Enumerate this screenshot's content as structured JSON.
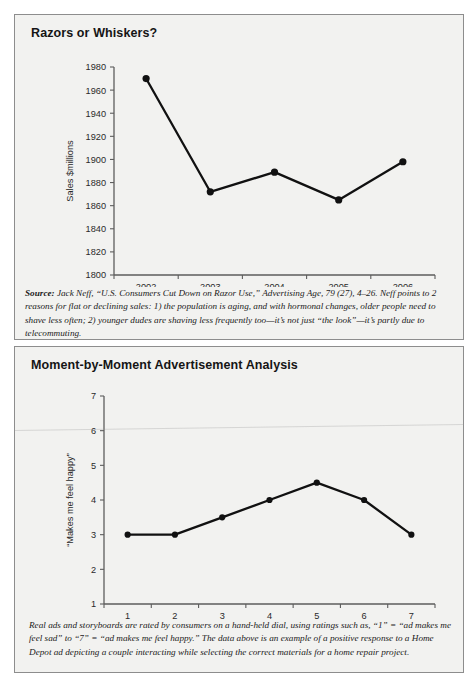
{
  "document": {
    "background_color": "#ffffff",
    "panel_color": "#f2f2f0",
    "border_color": "#8d8d8d",
    "ink_color": "#111111"
  },
  "exhibits": [
    {
      "title": "Razors or Whiskers?",
      "caption_lead": "Source:",
      "caption_body": " Jack Neff, “U.S. Consumers Cut Down on Razor Use,” Advertising Age, 79 (27), 4–26. Neff points to 2 reasons for flat or declining sales: 1) the population is aging, and with hormonal changes, older people need to shave less often; 2) younger dudes are shaving less frequently too—it’s not just “the look”—it’s partly due to telecommuting."
    },
    {
      "title": "Moment-by-Moment Advertisement Analysis",
      "caption_lead": "",
      "caption_body": "Real ads and storyboards are rated by consumers on a hand-held dial, using ratings such as, “1” = “ad makes me feel sad” to “7” = “ad makes me feel happy.” The data above is an example of a positive response to a Home Depot ad depicting a couple interacting while selecting the correct materials for a home repair project."
    }
  ],
  "chart_data": [
    {
      "type": "line",
      "title": "Razors or Whiskers?",
      "xlabel": "",
      "ylabel": "Sales $millions",
      "categories": [
        "2002",
        "2003",
        "2004",
        "2005",
        "2006"
      ],
      "x": [
        2002,
        2003,
        2004,
        2005,
        2006
      ],
      "values": [
        1970,
        1872,
        1889,
        1865,
        1898
      ],
      "ylim": [
        1800,
        1980
      ],
      "yticks": [
        1800,
        1820,
        1840,
        1860,
        1880,
        1900,
        1920,
        1940,
        1960,
        1980
      ],
      "ytick_labels": [
        "1800",
        "1820",
        "1840",
        "1860",
        "1880",
        "1900",
        "1920",
        "1940",
        "1960",
        "1980"
      ],
      "xtick_labels": [
        "2002",
        "2003",
        "2004",
        "2005",
        "2006"
      ],
      "grid": false,
      "legend": "none",
      "marker": "filled-circle",
      "line_color": "#111111"
    },
    {
      "type": "line",
      "title": "Moment-by-Moment Advertisement Analysis",
      "xlabel": "",
      "ylabel": "“Makes me feel happy”",
      "categories": [
        "1",
        "2",
        "3",
        "4",
        "5",
        "6",
        "7"
      ],
      "x": [
        1,
        2,
        3,
        4,
        5,
        6,
        7
      ],
      "values": [
        3,
        3,
        3.5,
        4,
        4.5,
        4,
        3
      ],
      "ylim": [
        1,
        7
      ],
      "yticks": [
        1,
        2,
        3,
        4,
        5,
        6,
        7
      ],
      "ytick_labels": [
        "1",
        "2",
        "3",
        "4",
        "5",
        "6",
        "7"
      ],
      "xtick_labels": [
        "1",
        "2",
        "3",
        "4",
        "5",
        "6",
        "7"
      ],
      "grid": false,
      "legend": "none",
      "marker": "filled-circle",
      "line_color": "#111111"
    }
  ]
}
